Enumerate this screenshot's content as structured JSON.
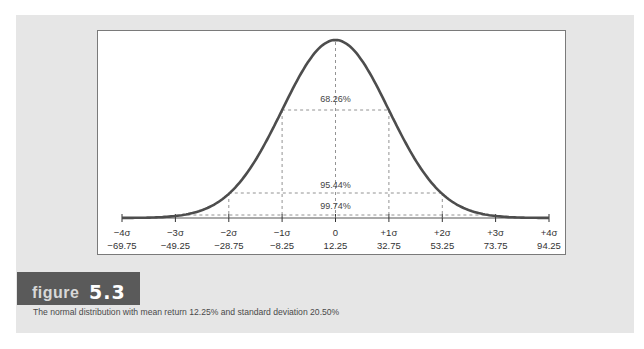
{
  "figure": {
    "label_word": "figure",
    "label_number": "5.3",
    "caption": "The normal distribution with mean return 12.25% and standard deviation 20.50%"
  },
  "colors": {
    "panel_bg": "#e6e6e6",
    "curve": "#4d4d4d",
    "label_box": "#5a5a5a"
  },
  "chart_data": {
    "type": "line",
    "title": "The normal distribution with mean return 12.25% and standard deviation 20.50%",
    "xlabel": "",
    "ylabel": "",
    "mean": 12.25,
    "std_dev": 20.5,
    "sigma_labels": [
      "−4σ",
      "−3σ",
      "−2σ",
      "−1σ",
      "0",
      "+1σ",
      "+2σ",
      "+3σ",
      "+4σ"
    ],
    "return_labels": [
      "−69.75",
      "−49.25",
      "−28.75",
      "−8.25",
      "12.25",
      "32.75",
      "53.25",
      "73.75",
      "94.25"
    ],
    "x": [
      -69.75,
      -49.25,
      -28.75,
      -8.25,
      12.25,
      32.75,
      53.25,
      73.75,
      94.25
    ],
    "annotations": [
      {
        "label": "68.26%",
        "range": [
          "−1σ",
          "+1σ"
        ]
      },
      {
        "label": "95.44%",
        "range": [
          "−2σ",
          "+2σ"
        ]
      },
      {
        "label": "99.74%",
        "range": [
          "−3σ",
          "+3σ"
        ]
      }
    ],
    "grid": false,
    "legend": "none"
  }
}
